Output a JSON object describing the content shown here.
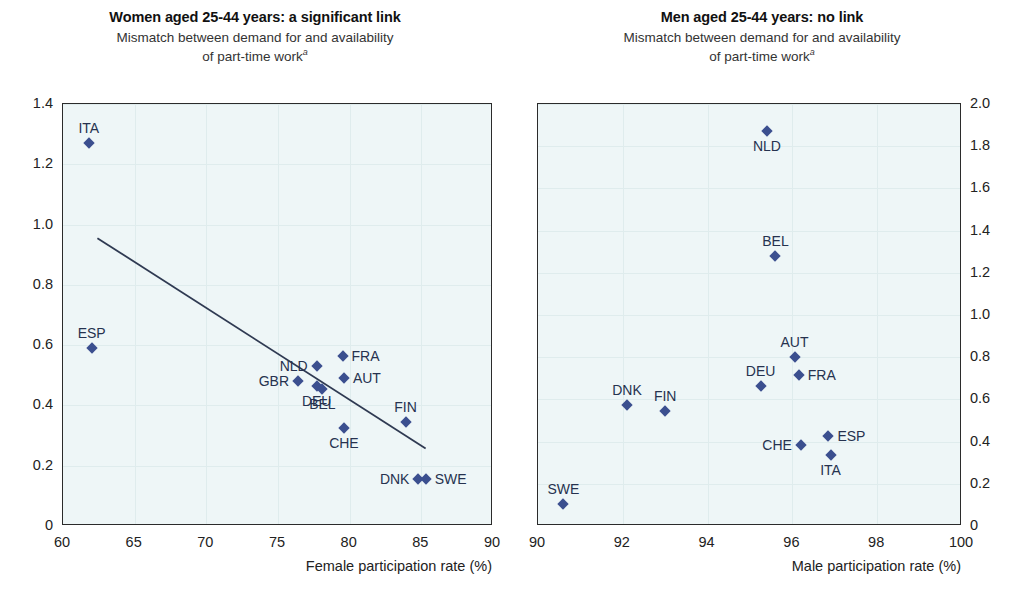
{
  "chart_data": [
    {
      "type": "scatter",
      "panel": "left",
      "title": "Women aged 25-44 years: a significant link",
      "subtitle_line1": "Mismatch between demand for and availability",
      "subtitle_line2": "of part-time work",
      "subtitle_superscript": "a",
      "xlabel": "Female participation rate (%)",
      "ylabel": "",
      "xlim": [
        60,
        90
      ],
      "ylim": [
        0,
        1.4
      ],
      "xticks": [
        "60",
        "65",
        "70",
        "75",
        "80",
        "85",
        "90"
      ],
      "xtick_values": [
        60,
        65,
        70,
        75,
        80,
        85,
        90
      ],
      "yticks": [
        "0",
        "0.2",
        "0.4",
        "0.6",
        "0.8",
        "1.0",
        "1.2",
        "1.4"
      ],
      "ytick_values": [
        0,
        0.2,
        0.4,
        0.6,
        0.8,
        1.0,
        1.2,
        1.4
      ],
      "ytick_side": "left",
      "grid": true,
      "legend": "none",
      "points": [
        {
          "label": "ITA",
          "x": 61.8,
          "y": 1.27,
          "label_pos": "above"
        },
        {
          "label": "ESP",
          "x": 62.0,
          "y": 0.59,
          "label_pos": "above"
        },
        {
          "label": "GBR",
          "x": 76.4,
          "y": 0.48,
          "label_pos": "left"
        },
        {
          "label": "NLD",
          "x": 77.7,
          "y": 0.53,
          "label_pos": "left"
        },
        {
          "label": "FRA",
          "x": 79.5,
          "y": 0.565,
          "label_pos": "right"
        },
        {
          "label": "AUT",
          "x": 79.6,
          "y": 0.49,
          "label_pos": "right"
        },
        {
          "label": "DEU",
          "x": 77.7,
          "y": 0.465,
          "label_pos": "below"
        },
        {
          "label": "BEL",
          "x": 78.1,
          "y": 0.455,
          "label_pos": "below"
        },
        {
          "label": "CHE",
          "x": 79.6,
          "y": 0.325,
          "label_pos": "below"
        },
        {
          "label": "FIN",
          "x": 83.9,
          "y": 0.345,
          "label_pos": "above"
        },
        {
          "label": "DNK",
          "x": 84.8,
          "y": 0.155,
          "label_pos": "left"
        },
        {
          "label": "SWE",
          "x": 85.3,
          "y": 0.155,
          "label_pos": "right"
        }
      ],
      "trendline": {
        "x1": 62.4,
        "y1": 0.955,
        "x2": 85.3,
        "y2": 0.257
      }
    },
    {
      "type": "scatter",
      "panel": "right",
      "title": "Men aged 25-44 years: no link",
      "subtitle_line1": "Mismatch between demand for and availability",
      "subtitle_line2": "of part-time work",
      "subtitle_superscript": "a",
      "xlabel": "Male participation rate (%)",
      "ylabel": "",
      "xlim": [
        90,
        100
      ],
      "ylim": [
        0,
        2.0
      ],
      "xticks": [
        "90",
        "92",
        "94",
        "96",
        "98",
        "100"
      ],
      "xtick_values": [
        90,
        92,
        94,
        96,
        98,
        100
      ],
      "yticks": [
        "0",
        "0.2",
        "0.4",
        "0.6",
        "0.8",
        "1.0",
        "1.2",
        "1.4",
        "1.6",
        "1.8",
        "2.0"
      ],
      "ytick_values": [
        0,
        0.2,
        0.4,
        0.6,
        0.8,
        1.0,
        1.2,
        1.4,
        1.6,
        1.8,
        2.0
      ],
      "ytick_side": "right",
      "grid": true,
      "legend": "none",
      "points": [
        {
          "label": "NLD",
          "x": 95.4,
          "y": 1.87,
          "label_pos": "below"
        },
        {
          "label": "BEL",
          "x": 95.6,
          "y": 1.28,
          "label_pos": "above"
        },
        {
          "label": "AUT",
          "x": 96.05,
          "y": 0.8,
          "label_pos": "above"
        },
        {
          "label": "FRA",
          "x": 96.15,
          "y": 0.715,
          "label_pos": "right"
        },
        {
          "label": "DEU",
          "x": 95.25,
          "y": 0.665,
          "label_pos": "above"
        },
        {
          "label": "DNK",
          "x": 92.1,
          "y": 0.575,
          "label_pos": "above"
        },
        {
          "label": "FIN",
          "x": 93.0,
          "y": 0.545,
          "label_pos": "above"
        },
        {
          "label": "ESP",
          "x": 96.85,
          "y": 0.425,
          "label_pos": "right"
        },
        {
          "label": "CHE",
          "x": 96.2,
          "y": 0.385,
          "label_pos": "left"
        },
        {
          "label": "ITA",
          "x": 96.9,
          "y": 0.335,
          "label_pos": "below"
        },
        {
          "label": "SWE",
          "x": 90.6,
          "y": 0.105,
          "label_pos": "above"
        }
      ],
      "trendline": null
    }
  ],
  "colors": {
    "marker": "#3b4f8f",
    "plot_background": "#eef6f7",
    "axis": "#2b2b2b",
    "gridline": "#dfeced",
    "label_text": "#26324f"
  }
}
